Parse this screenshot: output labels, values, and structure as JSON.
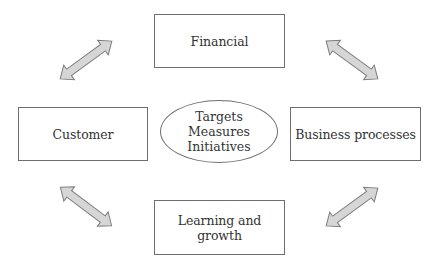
{
  "diagram": {
    "type": "balanced-scorecard",
    "center": {
      "lines": [
        "Targets",
        "Measures",
        "Initiatives"
      ]
    },
    "perspectives": {
      "top": "Financial",
      "left": "Customer",
      "right": "Business processes",
      "bottom": "Learning and growth"
    },
    "connectors": [
      {
        "name": "customer-financial",
        "from": "Customer",
        "to": "Financial",
        "style": "double-headed-arrow"
      },
      {
        "name": "financial-business",
        "from": "Financial",
        "to": "Business processes",
        "style": "double-headed-arrow"
      },
      {
        "name": "customer-learning",
        "from": "Customer",
        "to": "Learning and growth",
        "style": "double-headed-arrow"
      },
      {
        "name": "learning-business",
        "from": "Learning and growth",
        "to": "Business processes",
        "style": "double-headed-arrow"
      }
    ],
    "colors": {
      "arrow_fill": "#d6d6d6",
      "arrow_stroke": "#7c7c7c",
      "box_border": "#6e6e6e",
      "text": "#333333",
      "background": "#ffffff"
    }
  }
}
